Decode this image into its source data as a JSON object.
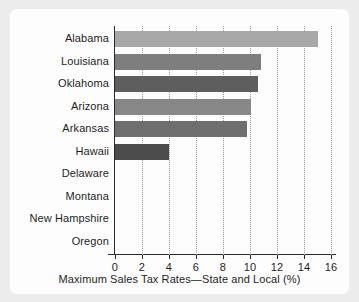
{
  "chart_data": {
    "type": "bar",
    "orientation": "horizontal",
    "title": "",
    "xlabel": "Maximum Sales Tax Rates—State and Local (%)",
    "ylabel": "",
    "categories": [
      "Alabama",
      "Louisiana",
      "Oklahoma",
      "Arizona",
      "Arkansas",
      "Hawaii",
      "Delaware",
      "Montana",
      "New Hampshire",
      "Oregon"
    ],
    "values": [
      15.0,
      10.8,
      10.6,
      10.1,
      9.8,
      4.0,
      0,
      0,
      0,
      0
    ],
    "bar_colors": [
      "#a8a8a8",
      "#7e7e7e",
      "#5e5e5e",
      "#878787",
      "#6f6f6f",
      "#4b4b4b",
      "#6f6f6f",
      "#6f6f6f",
      "#6f6f6f",
      "#6f6f6f"
    ],
    "xlim": [
      0,
      16
    ],
    "xticks": [
      0,
      2,
      4,
      6,
      8,
      10,
      12,
      14,
      16
    ],
    "xtick_labels": [
      "0",
      "2",
      "4",
      "6",
      "8",
      "10",
      "12",
      "14",
      "16"
    ],
    "grid": "vertical-dotted",
    "legend": "none",
    "background": "#fdfdfd",
    "page_background": "#ececed"
  }
}
